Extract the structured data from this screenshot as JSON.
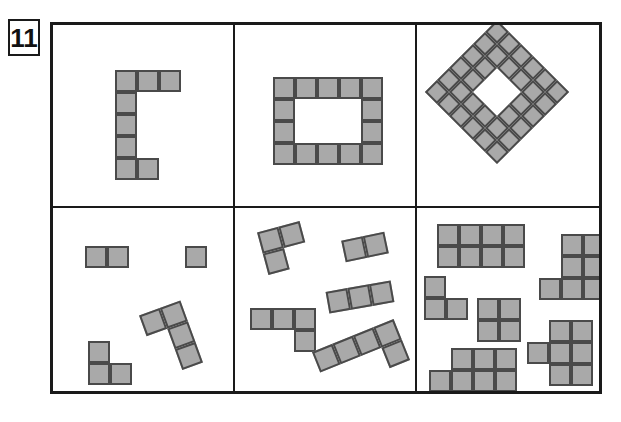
{
  "worksheet": {
    "task_number": "11",
    "colors": {
      "cell_fill": "#a9a9a9",
      "cell_stroke": "#4a4a4a",
      "frame_stroke": "#1a1a1a",
      "background": "#ffffff"
    },
    "frame": {
      "x": 50,
      "y": 22,
      "width": 552,
      "height": 372,
      "rows": 2,
      "cols": 3
    }
  },
  "panels": [
    {
      "id": "panel-1",
      "name": "c-shape-panel",
      "position": "top-left",
      "cell_size": 22,
      "shape_count": 1,
      "shapes": [
        {
          "name": "c-pentomino-hexomino",
          "squares": 7,
          "rotation": 0,
          "origin": {
            "x": 62,
            "y": 45
          },
          "cells": [
            [
              0,
              0
            ],
            [
              1,
              0
            ],
            [
              2,
              0
            ],
            [
              0,
              1
            ],
            [
              0,
              2
            ],
            [
              0,
              3
            ],
            [
              0,
              4
            ],
            [
              1,
              4
            ]
          ]
        }
      ]
    },
    {
      "id": "panel-2",
      "name": "rectangular-ring-panel",
      "position": "top-middle",
      "cell_size": 22,
      "shape_count": 1,
      "shapes": [
        {
          "name": "rectangular-ring",
          "squares": 14,
          "rotation": 0,
          "origin": {
            "x": 38,
            "y": 52
          },
          "cells": [
            [
              0,
              0
            ],
            [
              1,
              0
            ],
            [
              2,
              0
            ],
            [
              3,
              0
            ],
            [
              4,
              0
            ],
            [
              0,
              1
            ],
            [
              4,
              1
            ],
            [
              0,
              2
            ],
            [
              4,
              2
            ],
            [
              0,
              3
            ],
            [
              1,
              3
            ],
            [
              2,
              3
            ],
            [
              3,
              3
            ],
            [
              4,
              3
            ]
          ]
        }
      ]
    },
    {
      "id": "panel-3",
      "name": "diamond-ring-panel",
      "position": "top-right",
      "cell_size": 17,
      "shape_count": 1,
      "shapes": [
        {
          "name": "diamond-square-ring",
          "squares": 32,
          "rotation": 45,
          "grid": "6x6 with 2x2 centre hole",
          "origin": {
            "x": 29,
            "y": 16
          }
        }
      ]
    },
    {
      "id": "panel-4",
      "name": "small-scattered-pieces-panel",
      "position": "bottom-left",
      "cell_size": 22,
      "shape_count": 4,
      "shapes": [
        {
          "name": "domino",
          "squares": 2,
          "rotation": 0,
          "origin": {
            "x": 32,
            "y": 38
          },
          "cells": [
            [
              0,
              0
            ],
            [
              1,
              0
            ]
          ]
        },
        {
          "name": "monomino",
          "squares": 1,
          "rotation": 0,
          "origin": {
            "x": 132,
            "y": 38
          },
          "cells": [
            [
              0,
              0
            ]
          ]
        },
        {
          "name": "l-tromino",
          "squares": 3,
          "rotation": 0,
          "origin": {
            "x": 35,
            "y": 133
          },
          "cells": [
            [
              0,
              0
            ],
            [
              0,
              1
            ],
            [
              1,
              1
            ]
          ]
        },
        {
          "name": "j-tetromino",
          "squares": 4,
          "rotation": -20,
          "origin": {
            "x": 96,
            "y": 98
          },
          "cells": [
            [
              0,
              0
            ],
            [
              1,
              0
            ],
            [
              1,
              1
            ],
            [
              1,
              2
            ]
          ]
        }
      ]
    },
    {
      "id": "panel-5",
      "name": "rotated-pieces-panel",
      "position": "bottom-middle",
      "cell_size": 22,
      "shape_count": 5,
      "shapes": [
        {
          "name": "l-tromino-rotated",
          "squares": 3,
          "rotation": -15,
          "origin": {
            "x": 27,
            "y": 18
          },
          "cells": [
            [
              0,
              0
            ],
            [
              1,
              0
            ],
            [
              0,
              1
            ]
          ]
        },
        {
          "name": "domino-rotated",
          "squares": 2,
          "rotation": -12,
          "origin": {
            "x": 108,
            "y": 28
          },
          "cells": [
            [
              0,
              0
            ],
            [
              1,
              0
            ]
          ]
        },
        {
          "name": "i-tromino-rotated",
          "squares": 3,
          "rotation": -10,
          "origin": {
            "x": 92,
            "y": 78
          },
          "cells": [
            [
              0,
              0
            ],
            [
              1,
              0
            ],
            [
              2,
              0
            ]
          ]
        },
        {
          "name": "l-tetromino",
          "squares": 4,
          "rotation": 0,
          "origin": {
            "x": 15,
            "y": 100
          },
          "cells": [
            [
              0,
              0
            ],
            [
              1,
              0
            ],
            [
              2,
              0
            ],
            [
              2,
              1
            ]
          ]
        },
        {
          "name": "l-pentomino-rotated",
          "squares": 5,
          "rotation": -22,
          "origin": {
            "x": 82,
            "y": 126
          },
          "cells": [
            [
              0,
              0
            ],
            [
              1,
              0
            ],
            [
              2,
              0
            ],
            [
              3,
              0
            ],
            [
              3,
              1
            ]
          ]
        }
      ]
    },
    {
      "id": "panel-6",
      "name": "large-pieces-panel",
      "position": "bottom-right",
      "cell_size": 22,
      "shape_count": 6,
      "shapes": [
        {
          "name": "rectangle-4x2",
          "squares": 8,
          "rotation": 0,
          "origin": {
            "x": 20,
            "y": 16
          },
          "cells": [
            [
              0,
              0
            ],
            [
              1,
              0
            ],
            [
              2,
              0
            ],
            [
              3,
              0
            ],
            [
              0,
              1
            ],
            [
              1,
              1
            ],
            [
              2,
              1
            ],
            [
              3,
              1
            ]
          ]
        },
        {
          "name": "p-heptomino-top-right",
          "squares": 7,
          "rotation": 0,
          "origin": {
            "x": 122,
            "y": 26
          },
          "cells": [
            [
              1,
              0
            ],
            [
              2,
              0
            ],
            [
              1,
              1
            ],
            [
              2,
              1
            ],
            [
              0,
              2
            ],
            [
              1,
              2
            ],
            [
              2,
              2
            ]
          ]
        },
        {
          "name": "l-tromino-small",
          "squares": 3,
          "rotation": 0,
          "origin": {
            "x": 7,
            "y": 68
          },
          "cells": [
            [
              0,
              0
            ],
            [
              0,
              1
            ],
            [
              1,
              1
            ]
          ]
        },
        {
          "name": "square-tetromino",
          "squares": 4,
          "rotation": 0,
          "origin": {
            "x": 60,
            "y": 90
          },
          "cells": [
            [
              0,
              0
            ],
            [
              1,
              0
            ],
            [
              0,
              1
            ],
            [
              1,
              1
            ]
          ]
        },
        {
          "name": "p-heptomino-bottom-right",
          "squares": 7,
          "rotation": 0,
          "origin": {
            "x": 110,
            "y": 112
          },
          "cells": [
            [
              1,
              0
            ],
            [
              2,
              0
            ],
            [
              0,
              1
            ],
            [
              1,
              1
            ],
            [
              2,
              1
            ],
            [
              1,
              2
            ],
            [
              2,
              2
            ]
          ]
        },
        {
          "name": "p-heptomino-bottom-left",
          "squares": 7,
          "rotation": 0,
          "origin": {
            "x": 12,
            "y": 140
          },
          "cells": [
            [
              1,
              0
            ],
            [
              2,
              0
            ],
            [
              3,
              0
            ],
            [
              0,
              1
            ],
            [
              1,
              1
            ],
            [
              2,
              1
            ],
            [
              3,
              1
            ]
          ]
        }
      ]
    }
  ]
}
